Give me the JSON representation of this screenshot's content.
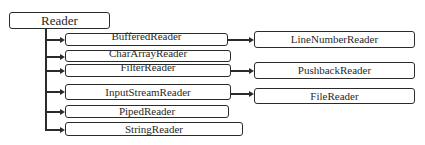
{
  "diagram": {
    "root": {
      "label": "Reader"
    },
    "children": [
      {
        "label": "BufferedReader",
        "subclass": {
          "label": "LineNumberReader"
        }
      },
      {
        "label": "CharArrayReader"
      },
      {
        "label": "FilterReader",
        "subclass": {
          "label": "PushbackReader"
        }
      },
      {
        "label": "InputStreamReader",
        "subclass": {
          "label": "FileReader"
        }
      },
      {
        "label": "PipedReader"
      },
      {
        "label": "StringReader"
      }
    ]
  },
  "colors": {
    "line": "#2b2b2b",
    "background": "#ffffff"
  }
}
